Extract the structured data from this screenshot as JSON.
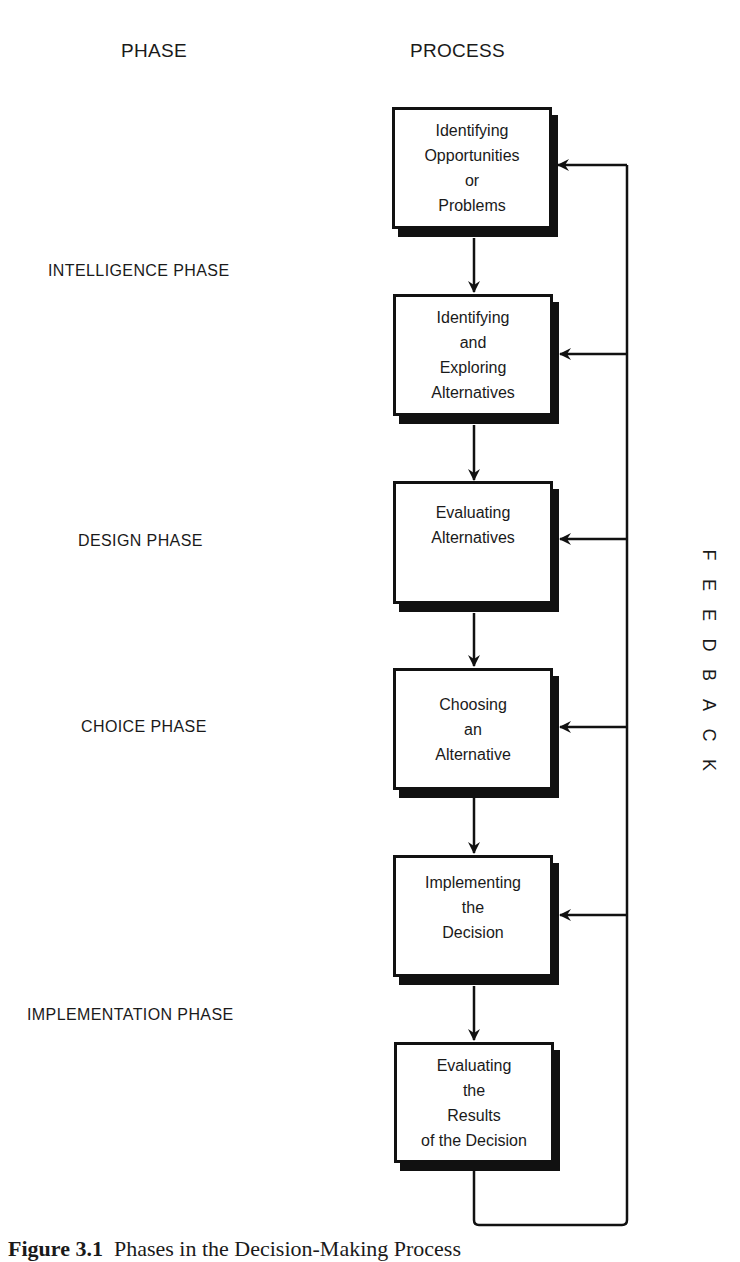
{
  "headers": {
    "phase": "PHASE",
    "process": "PROCESS"
  },
  "phases": [
    {
      "label": "INTELLIGENCE PHASE"
    },
    {
      "label": "DESIGN PHASE"
    },
    {
      "label": "CHOICE PHASE"
    },
    {
      "label": "IMPLEMENTATION PHASE"
    }
  ],
  "process_steps": [
    {
      "lines": [
        "Identifying",
        "Opportunities",
        "or",
        "Problems"
      ]
    },
    {
      "lines": [
        "Identifying",
        "and",
        "Exploring",
        "Alternatives"
      ]
    },
    {
      "lines": [
        "Evaluating",
        "Alternatives"
      ]
    },
    {
      "lines": [
        "Choosing",
        "an",
        "Alternative"
      ]
    },
    {
      "lines": [
        "Implementing",
        "the",
        "Decision"
      ]
    },
    {
      "lines": [
        "Evaluating",
        "the",
        "Results",
        "of the Decision"
      ]
    }
  ],
  "feedback": {
    "letters": [
      "F",
      "E",
      "E",
      "D",
      "B",
      "A",
      "C",
      "K"
    ]
  },
  "caption": {
    "label": "Figure 3.1",
    "text": "Phases in the Decision-Making Process"
  }
}
